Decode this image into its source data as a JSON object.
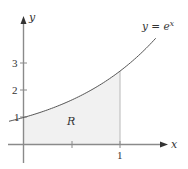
{
  "figure": {
    "axis_x_label": "x",
    "axis_y_label": "y",
    "curve_label": "y = e",
    "curve_label_exp": "x",
    "region_label": "R",
    "y_ticks": [
      "1",
      "2",
      "3"
    ],
    "x_ticks": [
      "1"
    ],
    "colors": {
      "axis": "#8a8a8a",
      "curve": "#555555",
      "fill": "#f1f1f1",
      "boundary": "#b8b8b8",
      "text": "#333333"
    }
  },
  "chart_data": {
    "type": "area",
    "title": "",
    "function": "y = e^x",
    "shaded_region": {
      "label": "R",
      "x_from": 0,
      "x_to": 1,
      "under": "y = e^x",
      "above": "x-axis"
    },
    "x": [
      -0.15,
      0,
      0.25,
      0.5,
      0.75,
      1.0,
      1.25,
      1.38
    ],
    "series": [
      {
        "name": "y = e^x",
        "values": [
          0.861,
          1.0,
          1.284,
          1.649,
          2.117,
          2.718,
          3.49,
          3.975
        ]
      }
    ],
    "xlabel": "x",
    "ylabel": "y",
    "x_ticks": [
      0.5,
      1
    ],
    "x_tick_labels": [
      "",
      "1"
    ],
    "y_ticks": [
      1,
      2,
      3
    ],
    "y_tick_labels": [
      "1",
      "2",
      "3"
    ],
    "xlim": [
      -0.15,
      1.5
    ],
    "ylim": [
      -0.7,
      4.7
    ],
    "grid": false,
    "legend": "none"
  }
}
